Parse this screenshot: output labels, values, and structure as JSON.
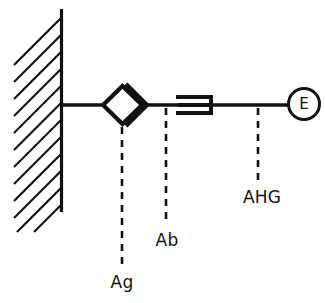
{
  "diagram": {
    "background_color": "#ffffff",
    "ink_color": "#111111",
    "wall": {
      "name": "red-cell-membrane-wall",
      "hatch_count": 12,
      "hatch_angle_deg": 45
    },
    "components": [
      {
        "id": "ag",
        "symbol": "diamond-with-chevron",
        "label": "Ag",
        "label_x": 108,
        "label_y": 288,
        "leader_x": 122,
        "leader_y1": 127,
        "leader_y2": 266
      },
      {
        "id": "ab",
        "symbol": "antibody-bracket",
        "label": "Ab",
        "label_x": 157,
        "label_y": 246,
        "leader_x": 166,
        "leader_y1": 108,
        "leader_y2": 224
      },
      {
        "id": "ahg",
        "symbol": "backbone-link",
        "label": "AHG",
        "label_x": 239,
        "label_y": 203,
        "leader_x": 258,
        "leader_y1": 108,
        "leader_y2": 181
      }
    ],
    "enzyme_marker": {
      "id": "enzyme",
      "label": "E",
      "shape": "circle",
      "cx": 304,
      "cy": 104,
      "r": 16
    },
    "labels": {
      "ag": "Ag",
      "ab": "Ab",
      "ahg": "AHG",
      "enzyme": "E"
    }
  }
}
